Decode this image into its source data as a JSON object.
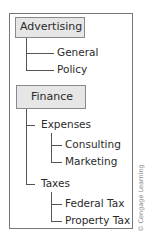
{
  "diagram": {
    "type": "tree",
    "groups": [
      {
        "label": "Advertising",
        "children": [
          {
            "label": "General"
          },
          {
            "label": "Policy"
          }
        ]
      },
      {
        "label": "Finance",
        "children": [
          {
            "label": "Expenses",
            "children": [
              {
                "label": "Consulting"
              },
              {
                "label": "Marketing"
              }
            ]
          },
          {
            "label": "Taxes",
            "children": [
              {
                "label": "Federal Tax"
              },
              {
                "label": "Property Tax"
              }
            ]
          }
        ]
      }
    ]
  },
  "credit": "© Cengage Learning",
  "colors": {
    "root_fill": "#e6e6e6",
    "line": "#555555",
    "frame": "#777777"
  }
}
